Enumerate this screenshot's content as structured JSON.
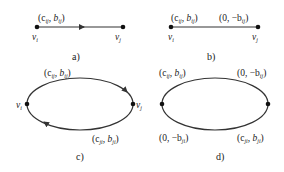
{
  "panels": [
    {
      "caption": "a)",
      "nodes": [
        {
          "label": "v",
          "sub": "i"
        },
        {
          "label": "v",
          "sub": "j"
        }
      ],
      "edges": [
        {
          "label_main": "(c",
          "label_sub1": "ij",
          "label_mid": ", b",
          "label_sub2": "ij",
          "label_end": ")",
          "directed": true
        }
      ]
    },
    {
      "caption": "b)",
      "nodes": [
        {
          "label": "v",
          "sub": "i"
        },
        {
          "label": "v",
          "sub": "j"
        }
      ],
      "edges": [
        {
          "label_main": "(c",
          "label_sub1": "ij",
          "label_mid": ", b",
          "label_sub2": "ij",
          "label_end": ")"
        },
        {
          "label_main": "(0, −b",
          "label_sub1": "ij",
          "label_end": ")"
        }
      ]
    },
    {
      "caption": "c)",
      "nodes": [
        {
          "label": "v",
          "sub": "i"
        },
        {
          "label": "v",
          "sub": "j"
        }
      ],
      "edges": [
        {
          "label_main": "(c",
          "label_sub1": "ij",
          "label_mid": ", b",
          "label_sub2": "ij",
          "label_end": ")",
          "directed": true
        },
        {
          "label_main": "(c",
          "label_sub1": "ji",
          "label_mid": ", b",
          "label_sub2": "ji",
          "label_end": ")",
          "directed": true
        }
      ]
    },
    {
      "caption": "d)",
      "nodes": [
        {
          "label": "v",
          "sub": "i"
        },
        {
          "label": "v",
          "sub": "j"
        }
      ],
      "edges": [
        {
          "label_main": "(c",
          "label_sub1": "ij",
          "label_mid": ", b",
          "label_sub2": "ij",
          "label_end": ")"
        },
        {
          "label_main": "(0, −b",
          "label_sub1": "ij",
          "label_end": ")"
        },
        {
          "label_main": "(0, −b",
          "label_sub1": "ji",
          "label_end": ")"
        },
        {
          "label_main": "(c",
          "label_sub1": "ji",
          "label_mid": ", b",
          "label_sub2": "ji",
          "label_end": ")"
        }
      ]
    }
  ]
}
